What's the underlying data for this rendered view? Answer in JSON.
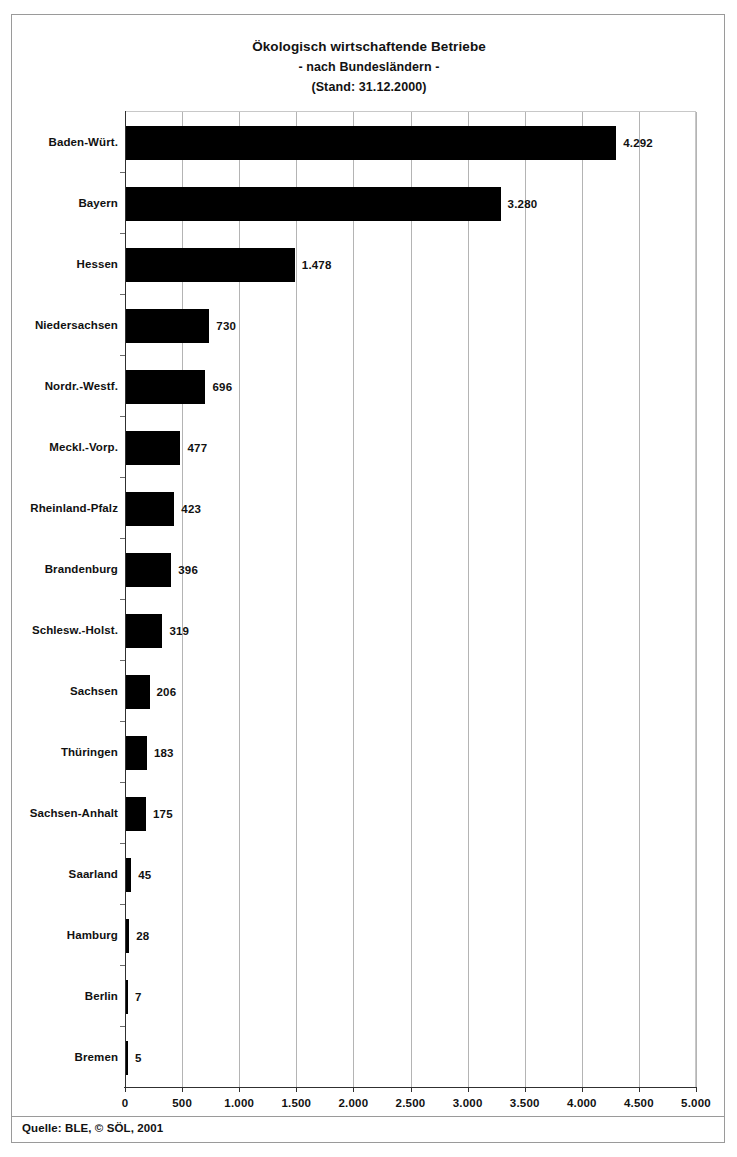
{
  "figure": {
    "title_lines": [
      "Ökologisch wirtschaftende Betriebe",
      "- nach Bundesländern -",
      "(Stand: 31.12.2000)"
    ],
    "source": "Quelle: BLE, © SÖL, 2001"
  },
  "chart_data": {
    "type": "bar",
    "orientation": "horizontal",
    "title": "Ökologisch wirtschaftende Betriebe - nach Bundesländern - (Stand: 31.12.2000)",
    "subtitle": "- nach Bundesländern -",
    "annotation": "(Stand: 31.12.2000)",
    "xlabel": "",
    "ylabel": "",
    "xlim": [
      0,
      5000
    ],
    "grid": true,
    "legend": null,
    "bar_color": "#000000",
    "xticks": [
      0,
      500,
      1000,
      1500,
      2000,
      2500,
      3000,
      3500,
      4000,
      4500,
      5000
    ],
    "xtick_labels": [
      "0",
      "500",
      "1.000",
      "1.500",
      "2.000",
      "2.500",
      "3.000",
      "3.500",
      "4.000",
      "4.500",
      "5.000"
    ],
    "categories": [
      "Baden-Würt.",
      "Bayern",
      "Hessen",
      "Niedersachsen",
      "Nordr.-Westf.",
      "Meckl.-Vorp.",
      "Rheinland-Pfalz",
      "Brandenburg",
      "Schlesw.-Holst.",
      "Sachsen",
      "Thüringen",
      "Sachsen-Anhalt",
      "Saarland",
      "Hamburg",
      "Berlin",
      "Bremen"
    ],
    "values": [
      4292,
      3280,
      1478,
      730,
      696,
      477,
      423,
      396,
      319,
      206,
      183,
      175,
      45,
      28,
      7,
      5
    ],
    "value_labels": [
      "4.292",
      "3.280",
      "1.478",
      "730",
      "696",
      "477",
      "423",
      "396",
      "319",
      "206",
      "183",
      "175",
      "45",
      "28",
      "7",
      "5"
    ]
  }
}
